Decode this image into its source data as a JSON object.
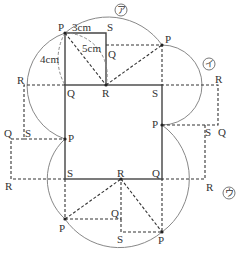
{
  "diagram": {
    "type": "geometry-figure",
    "colors": {
      "solid": "#444444",
      "dashed": "#333333",
      "arc": "#888888",
      "text": "#333333"
    },
    "dimensions": {
      "width_label": "3cm",
      "height_label": "4cm",
      "diagonal_label": "5cm"
    },
    "region_labels": {
      "a": "ア",
      "i": "イ",
      "u": "ウ"
    },
    "vertices": {
      "top_rect": {
        "P": "P",
        "S": "S",
        "Q": "Q",
        "R": "R"
      },
      "top_right": {
        "P": "P",
        "Q": "Q"
      },
      "square_top": {
        "Q": "Q",
        "R": "R",
        "S": "S"
      },
      "right_upper": {
        "R": "R",
        "P": "P",
        "S": "S",
        "Q": "Q"
      },
      "left_upper": {
        "R": "R",
        "Q": "Q",
        "S": "S",
        "P": "P"
      },
      "left_lower": {
        "R": "R"
      },
      "right_lower": {
        "R": "R"
      },
      "square_bottom": {
        "S": "S",
        "R": "R",
        "Q": "Q"
      },
      "bottom": {
        "P_left": "P",
        "Q": "Q",
        "S": "S",
        "P_right": "P"
      }
    }
  }
}
